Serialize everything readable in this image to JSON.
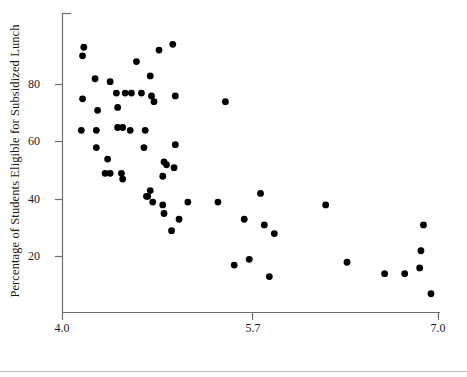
{
  "chart_data": {
    "type": "scatter",
    "title": "",
    "xlabel": "Average Sixth-Grade Reading Score in Grade Equivalent Units",
    "ylabel": "Percentage of Students Eligible for Subsidized Lunch",
    "xlim": [
      4.0,
      7.0
    ],
    "ylim": [
      0,
      100
    ],
    "xticks": [
      4.0,
      5.7,
      7.0
    ],
    "xtick_labels": [
      "4.0",
      "5.7",
      "7.0"
    ],
    "yticks": [
      20,
      40,
      60,
      80
    ],
    "ytick_labels": [
      "20",
      "40",
      "60",
      "80"
    ],
    "grid": false,
    "legend": null,
    "marker": "filled-circle",
    "marker_color": "#000000",
    "axis_color": "#6e6e6e",
    "points": [
      {
        "x": 4.17,
        "y": 93
      },
      {
        "x": 4.16,
        "y": 90
      },
      {
        "x": 4.59,
        "y": 88
      },
      {
        "x": 4.77,
        "y": 92
      },
      {
        "x": 4.88,
        "y": 94
      },
      {
        "x": 4.26,
        "y": 82
      },
      {
        "x": 4.38,
        "y": 81
      },
      {
        "x": 4.7,
        "y": 83
      },
      {
        "x": 4.43,
        "y": 77
      },
      {
        "x": 4.5,
        "y": 77
      },
      {
        "x": 4.55,
        "y": 77
      },
      {
        "x": 4.63,
        "y": 77
      },
      {
        "x": 4.71,
        "y": 76
      },
      {
        "x": 4.9,
        "y": 76
      },
      {
        "x": 4.16,
        "y": 75
      },
      {
        "x": 4.73,
        "y": 74
      },
      {
        "x": 5.3,
        "y": 74
      },
      {
        "x": 4.28,
        "y": 71
      },
      {
        "x": 4.44,
        "y": 72
      },
      {
        "x": 4.15,
        "y": 64
      },
      {
        "x": 4.27,
        "y": 64
      },
      {
        "x": 4.44,
        "y": 65
      },
      {
        "x": 4.48,
        "y": 65
      },
      {
        "x": 4.54,
        "y": 64
      },
      {
        "x": 4.66,
        "y": 64
      },
      {
        "x": 4.27,
        "y": 58
      },
      {
        "x": 4.65,
        "y": 58
      },
      {
        "x": 4.9,
        "y": 59
      },
      {
        "x": 4.36,
        "y": 54
      },
      {
        "x": 4.81,
        "y": 53
      },
      {
        "x": 4.83,
        "y": 52
      },
      {
        "x": 4.34,
        "y": 49
      },
      {
        "x": 4.38,
        "y": 49
      },
      {
        "x": 4.47,
        "y": 49
      },
      {
        "x": 4.48,
        "y": 47
      },
      {
        "x": 4.8,
        "y": 48
      },
      {
        "x": 4.89,
        "y": 51
      },
      {
        "x": 4.7,
        "y": 43
      },
      {
        "x": 4.67,
        "y": 41
      },
      {
        "x": 4.68,
        "y": 41
      },
      {
        "x": 4.72,
        "y": 39
      },
      {
        "x": 4.8,
        "y": 38
      },
      {
        "x": 4.81,
        "y": 35
      },
      {
        "x": 4.93,
        "y": 33
      },
      {
        "x": 4.87,
        "y": 29
      },
      {
        "x": 5.0,
        "y": 39
      },
      {
        "x": 5.24,
        "y": 39
      },
      {
        "x": 5.45,
        "y": 33
      },
      {
        "x": 5.58,
        "y": 42
      },
      {
        "x": 5.61,
        "y": 31
      },
      {
        "x": 5.69,
        "y": 28
      },
      {
        "x": 6.1,
        "y": 38
      },
      {
        "x": 5.37,
        "y": 17
      },
      {
        "x": 5.49,
        "y": 19
      },
      {
        "x": 5.65,
        "y": 13
      },
      {
        "x": 6.27,
        "y": 18
      },
      {
        "x": 6.57,
        "y": 14
      },
      {
        "x": 6.73,
        "y": 14
      },
      {
        "x": 6.85,
        "y": 16
      },
      {
        "x": 6.86,
        "y": 22
      },
      {
        "x": 6.88,
        "y": 31
      },
      {
        "x": 6.94,
        "y": 7
      }
    ]
  },
  "axes": {
    "y_title": "Percentage of Students Eligible for Subsidized Lunch",
    "x_title": "Average Sixth-Grade Reading Score in Grade Equivalent Units",
    "x_tick_0": "4.0",
    "x_tick_1": "5.7",
    "x_tick_2": "7.0",
    "y_tick_0": "20",
    "y_tick_1": "40",
    "y_tick_2": "60",
    "y_tick_3": "80"
  }
}
